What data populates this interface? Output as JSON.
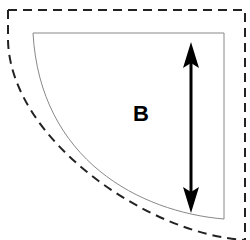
{
  "diagram": {
    "label": "B",
    "shape": "quarter-round region",
    "outer_boundary": "dashed",
    "inner_boundary": "solid",
    "dimension_arrow": "double-headed vertical",
    "colors": {
      "outer_stroke": "#222222",
      "inner_stroke": "#888888",
      "arrow": "#000000",
      "label": "#000000"
    }
  }
}
